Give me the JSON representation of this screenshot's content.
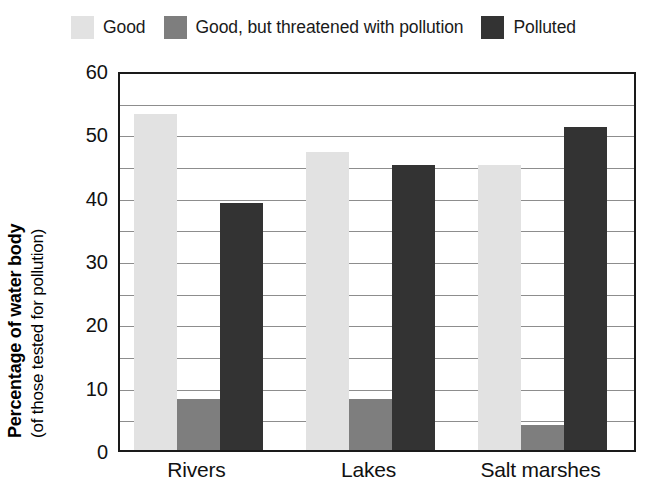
{
  "chart_data": {
    "type": "bar",
    "title": "",
    "xlabel": "",
    "ylabel": "Percentage of water body",
    "ylabel_sub": "(of those tested for pollution)",
    "categories": [
      "Rivers",
      "Lakes",
      "Salt marshes"
    ],
    "series": [
      {
        "name": "Good",
        "color": "#e2e2e2",
        "values": [
          53,
          47,
          45
        ]
      },
      {
        "name": "Good, but threatened with pollution",
        "color": "#7e7e7e",
        "values": [
          8,
          8,
          4
        ]
      },
      {
        "name": "Polluted",
        "color": "#333333",
        "values": [
          39,
          45,
          51
        ]
      }
    ],
    "ylim": [
      0,
      60
    ],
    "yticks": [
      0,
      10,
      20,
      30,
      40,
      50,
      60
    ],
    "ytick_labels": [
      "0",
      "10",
      "20",
      "30",
      "40",
      "50",
      "60"
    ],
    "minor_tick_step": 5,
    "grid": true,
    "grid_axis": "y",
    "legend_position": "top"
  },
  "legend": {
    "items": [
      {
        "label": "Good",
        "color": "#e2e2e2"
      },
      {
        "label": "Good, but threatened with pollution",
        "color": "#7e7e7e"
      },
      {
        "label": "Polluted",
        "color": "#333333"
      }
    ]
  },
  "axes": {
    "y_title_main": "Percentage of water body",
    "y_title_sub": "(of those tested for pollution)",
    "y_tick_labels": [
      "60",
      "50",
      "40",
      "30",
      "20",
      "10",
      "0"
    ],
    "x_tick_labels": [
      "Rivers",
      "Lakes",
      "Salt marshes"
    ]
  },
  "colors": {
    "good": "#e2e2e2",
    "threatened": "#7e7e7e",
    "polluted": "#333333",
    "axis": "#1a1a1a",
    "gridline": "#8d8d8d",
    "background": "#ffffff",
    "text": "#111111"
  }
}
